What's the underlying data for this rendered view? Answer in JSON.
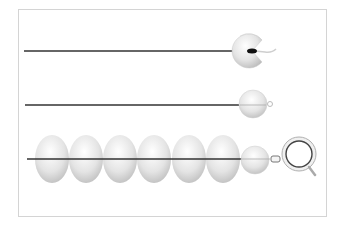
{
  "diagram": {
    "colors": {
      "frame": "#d4d4d4",
      "wire": "#333333",
      "pearl_light": "#ffffff",
      "pearl_mid": "#e6e6e6",
      "pearl_dark": "#bdbdbd",
      "clasp_ring": "#9a9a9a"
    },
    "steps": [
      {
        "step": 1,
        "description": "Wire knotted inside open clamshell bead tip"
      },
      {
        "step": 2,
        "description": "Bead tip closed around knot with loop"
      },
      {
        "step": 3,
        "description": "Strand of six pearls with bead tip attached to spring ring clasp"
      }
    ],
    "pearls_in_strand": 6
  }
}
